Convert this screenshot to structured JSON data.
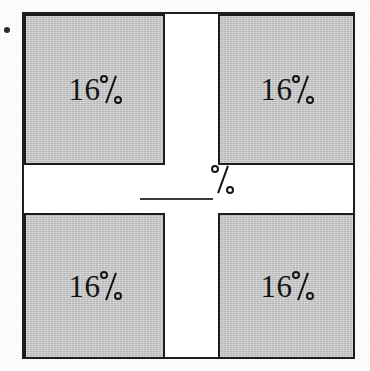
{
  "figure": {
    "bullet": {
      "name": "bullet-marker",
      "glyph": "•"
    },
    "quadrants": [
      {
        "position": "top-left",
        "label": "16%",
        "value": 16,
        "unit": "%",
        "fill": "#c9c9c9"
      },
      {
        "position": "top-right",
        "label": "16%",
        "value": 16,
        "unit": "%",
        "fill": "#c9c9c9"
      },
      {
        "position": "bottom-left",
        "label": "16%",
        "value": 16,
        "unit": "%",
        "fill": "#c9c9c9"
      },
      {
        "position": "bottom-right",
        "label": "16%",
        "value": 16,
        "unit": "%",
        "fill": "#c9c9c9"
      }
    ],
    "center": {
      "blank_label": "",
      "unit": "%",
      "description": "fill-in-the-blank underline followed by percent sign"
    },
    "colors": {
      "shaded_fill": "#c9c9c9",
      "outline": "#1c1c1c",
      "paper": "#fdfdfd",
      "ink": "#141414"
    }
  },
  "chart_data": {
    "type": "table",
    "categories": [
      "top-left",
      "top-right",
      "bottom-left",
      "bottom-right",
      "center cross"
    ],
    "values": [
      16,
      16,
      16,
      16,
      null
    ],
    "labels": [
      "16%",
      "16%",
      "16%",
      "16%",
      "__%"
    ],
    "ylabel": "percent of whole",
    "xlabel": "",
    "annotations": [
      "Each of the four corner squares is labeled 16%.",
      "The central white cross region is an unlabeled blank followed by %."
    ]
  }
}
